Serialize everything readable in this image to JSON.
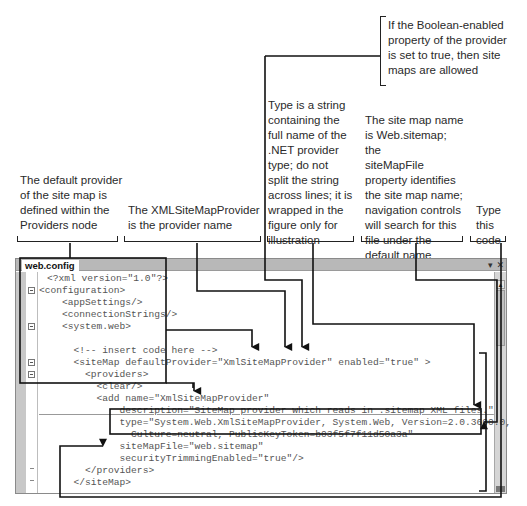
{
  "callouts": {
    "enabled": "If the Boolean-enabled\nproperty of the provider\nis set to true, then site\nmaps are allowed",
    "type_string": "Type is a string\ncontaining the\nfull name of the\n.NET provider\ntype; do not\nsplit the string\nacross lines; it is\nwrapped in the\nfigure only for\nillustration",
    "sitemap_file": "The site map name\nis Web.sitemap; the\nsiteMapFile\nproperty identifies\nthe site map name;\nnavigation controls\nwill search for this\nfile under the\ndefault name",
    "default_provider": "The default provider\nof the site map is\ndefined within the\nProviders node",
    "provider_name": "The XMLSiteMapProvider\nis the provider name",
    "type_code": "Type\nthis\ncode"
  },
  "editor": {
    "tab_label": "web.config",
    "dropdown_icon": "▾",
    "close_icon": "✕",
    "scroll_up_icon": "▲",
    "lines": [
      "<?xml version=\"1.0\"?>",
      "<configuration>",
      "    <appSettings/>",
      "    <connectionStrings/>",
      "    <system.web>",
      "",
      "      <!-- insert code here -->",
      "      <siteMap defaultProvider=\"XmlSiteMapProvider\" enabled=\"true\" >",
      "        <providers>",
      "          <clear/>",
      "          <add name=\"XmlSiteMapProvider\"",
      "              description=\"SiteMap provider which reads in .sitemap XML files.\"",
      "              type=\"System.Web.XmlSiteMapProvider, System.Web, Version=2.0.3600.0,",
      "                Culture=neutral, PublicKeyToken=b03f5f7f11d50a3a\"",
      "              siteMapFile=\"web.sitemap\"",
      "              securityTrimmingEnabled=\"true\"/>",
      "        </providers>",
      "      </siteMap>"
    ]
  }
}
